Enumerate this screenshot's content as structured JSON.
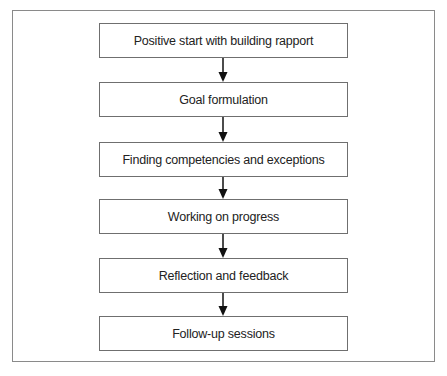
{
  "diagram": {
    "type": "vertical-flowchart",
    "steps": [
      {
        "label": "Positive start with building rapport"
      },
      {
        "label": "Goal formulation"
      },
      {
        "label": "Finding competencies and exceptions"
      },
      {
        "label": "Working on progress"
      },
      {
        "label": "Reflection and feedback"
      },
      {
        "label": "Follow-up sessions"
      }
    ],
    "connectors": [
      {
        "from": 0,
        "to": 1
      },
      {
        "from": 1,
        "to": 2
      },
      {
        "from": 2,
        "to": 3
      },
      {
        "from": 3,
        "to": 4
      },
      {
        "from": 4,
        "to": 5
      }
    ],
    "colors": {
      "box_border": "#6f6f6f",
      "frame_border": "#8a8a8a",
      "arrow": "#111111",
      "text": "#222222"
    }
  }
}
